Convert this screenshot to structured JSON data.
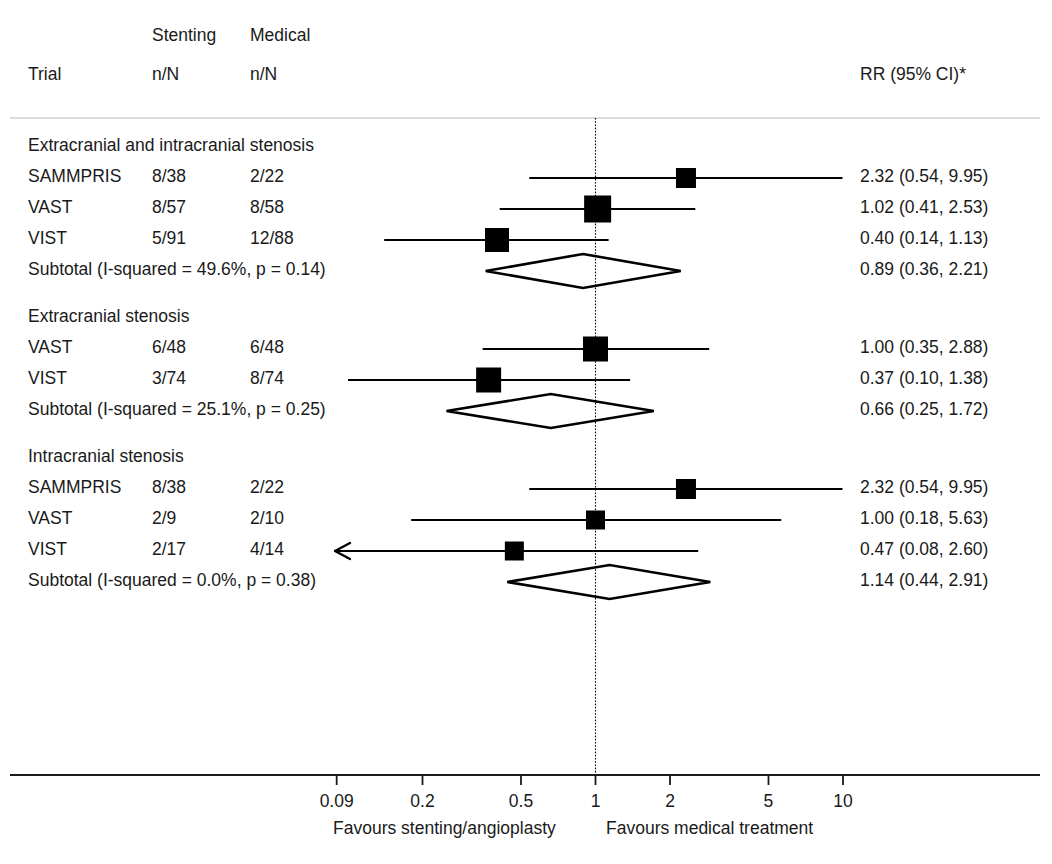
{
  "header": {
    "col_trial": "Trial",
    "col_stenting_top": "Stenting",
    "col_stenting_bottom": "n/N",
    "col_medical_top": "Medical",
    "col_medical_bottom": "n/N",
    "col_effect": "RR (95% CI)*"
  },
  "axis": {
    "ticks": [
      "0.09",
      "0.2",
      "0.5",
      "1",
      "2",
      "5",
      "10"
    ],
    "tick_values": [
      0.09,
      0.2,
      0.5,
      1,
      2,
      5,
      10
    ],
    "favours_left": "Favours stenting/angioplasty",
    "favours_right": "Favours medical treatment",
    "reference_value": "1"
  },
  "chart_data": {
    "type": "forest",
    "title": "",
    "xlabel": "Risk Ratio (log scale)",
    "ylabel": "",
    "xscale": "log",
    "xlim": [
      0.08,
      13
    ],
    "grid": false,
    "reference_line": 1,
    "columns": [
      "Trial",
      "Stenting n/N",
      "Medical n/N",
      "RR (95% CI)*"
    ],
    "groups": [
      {
        "label": "Extracranial and intracranial stenosis",
        "rows": [
          {
            "trial": "SAMMPRIS",
            "stenting": "8/38",
            "medical": "2/22",
            "effect_text": "2.32 (0.54, 9.95)",
            "rr": 2.32,
            "lcl": 0.54,
            "ucl": 9.95,
            "marker_size": 1.0,
            "truncated_left": false
          },
          {
            "trial": "VAST",
            "stenting": "8/57",
            "medical": "8/58",
            "effect_text": "1.02 (0.41, 2.53)",
            "rr": 1.02,
            "lcl": 0.41,
            "ucl": 2.53,
            "marker_size": 1.35,
            "truncated_left": false
          },
          {
            "trial": "VIST",
            "stenting": "5/91",
            "medical": "12/88",
            "effect_text": "0.40 (0.14, 1.13)",
            "rr": 0.4,
            "lcl": 0.14,
            "ucl": 1.13,
            "marker_size": 1.2,
            "truncated_left": false
          }
        ],
        "subtotal": {
          "label": "Subtotal  (I-squared = 49.6%, p = 0.14)",
          "effect_text": "0.89 (0.36, 2.21)",
          "rr": 0.89,
          "lcl": 0.36,
          "ucl": 2.21,
          "i_squared": "49.6%",
          "p_value": "0.14"
        }
      },
      {
        "label": "Extracranial stenosis",
        "rows": [
          {
            "trial": "VAST",
            "stenting": "6/48",
            "medical": "6/48",
            "effect_text": "1.00 (0.35, 2.88)",
            "rr": 1.0,
            "lcl": 0.35,
            "ucl": 2.88,
            "marker_size": 1.25,
            "truncated_left": false
          },
          {
            "trial": "VIST",
            "stenting": "3/74",
            "medical": "8/74",
            "effect_text": "0.37 (0.10, 1.38)",
            "rr": 0.37,
            "lcl": 0.1,
            "ucl": 1.38,
            "marker_size": 1.25,
            "truncated_left": false
          }
        ],
        "subtotal": {
          "label": "Subtotal  (I-squared = 25.1%, p = 0.25)",
          "effect_text": "0.66 (0.25, 1.72)",
          "rr": 0.66,
          "lcl": 0.25,
          "ucl": 1.72,
          "i_squared": "25.1%",
          "p_value": "0.25"
        }
      },
      {
        "label": "Intracranial stenosis",
        "rows": [
          {
            "trial": "SAMMPRIS",
            "stenting": "8/38",
            "medical": "2/22",
            "effect_text": "2.32 (0.54, 9.95)",
            "rr": 2.32,
            "lcl": 0.54,
            "ucl": 9.95,
            "marker_size": 1.0,
            "truncated_left": false
          },
          {
            "trial": "VAST",
            "stenting": "2/9",
            "medical": "2/10",
            "effect_text": "1.00 (0.18, 5.63)",
            "rr": 1.0,
            "lcl": 0.18,
            "ucl": 5.63,
            "marker_size": 0.95,
            "truncated_left": false
          },
          {
            "trial": "VIST",
            "stenting": "2/17",
            "medical": "4/14",
            "effect_text": "0.47 (0.08, 2.60)",
            "rr": 0.47,
            "lcl": 0.08,
            "ucl": 2.6,
            "marker_size": 0.95,
            "truncated_left": true
          }
        ],
        "subtotal": {
          "label": "Subtotal  (I-squared = 0.0%, p = 0.38)",
          "effect_text": "1.14 (0.44, 2.91)",
          "rr": 1.14,
          "lcl": 0.44,
          "ucl": 2.91,
          "i_squared": "0.0%",
          "p_value": "0.38"
        }
      }
    ]
  },
  "colors": {
    "marker": "#000000",
    "line": "#000000",
    "text": "#1a1a1a",
    "rule": "#cfcfcf",
    "background": "#ffffff"
  }
}
